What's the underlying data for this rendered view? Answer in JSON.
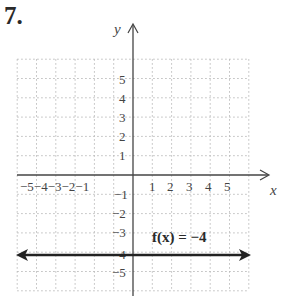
{
  "problem": {
    "number": "7."
  },
  "chart_data": {
    "type": "line",
    "title": "",
    "xlabel": "x",
    "ylabel": "y",
    "xlim": [
      -6,
      6
    ],
    "ylim": [
      -6,
      6
    ],
    "grid": true,
    "x_tick_labels": [
      "-5",
      "-4",
      "-3",
      "-2",
      "-1",
      "1",
      "2",
      "3",
      "4",
      "5"
    ],
    "y_tick_labels": [
      "5",
      "4",
      "3",
      "2",
      "1",
      "-1",
      "-2",
      "-3",
      "-4",
      "-5"
    ],
    "series": [
      {
        "name": "f(x) = -4",
        "x": [
          -6,
          6
        ],
        "y": [
          -4,
          -4
        ],
        "arrows": "both"
      }
    ],
    "annotations": [
      {
        "text": "f(x) = −4",
        "x": 1,
        "y": -3.4
      }
    ]
  },
  "labels": {
    "x_axis": "x",
    "y_axis": "y",
    "function": "f(x) = −4",
    "x_neg": "−5−4−3−2−1",
    "x_pos": [
      "1",
      "2",
      "3",
      "4",
      "5"
    ],
    "y_pos": [
      "5",
      "4",
      "3",
      "2",
      "1"
    ],
    "y_neg": [
      "−1",
      "−2",
      "−3",
      "−4",
      "−5"
    ]
  }
}
